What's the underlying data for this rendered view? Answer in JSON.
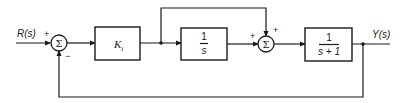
{
  "diagram": {
    "type": "control-system block diagram",
    "input": {
      "label": "R(s)"
    },
    "output": {
      "label": "Y(s)"
    },
    "summing_junctions": [
      {
        "id": "sum1",
        "symbol": "Σ",
        "signs": {
          "input": "+",
          "feedback": "−"
        }
      },
      {
        "id": "sum2",
        "symbol": "Σ",
        "signs": {
          "left": "+",
          "top": "+"
        }
      }
    ],
    "blocks": [
      {
        "id": "gain",
        "label": "K",
        "subscript": "i"
      },
      {
        "id": "integrator",
        "numerator": "1",
        "denominator": "s"
      },
      {
        "id": "plant",
        "numerator": "1",
        "denominator": "s + 1"
      }
    ],
    "connections": [
      "R(s) → sum1 (+)",
      "sum1 → K_i",
      "K_i → branch point",
      "branch point → 1/s → sum2 (+, left)",
      "branch point → feedforward → sum2 (+, top)",
      "sum2 → 1/(s+1) → Y(s)",
      "Y(s) → unity feedback → sum1 (−)"
    ]
  }
}
